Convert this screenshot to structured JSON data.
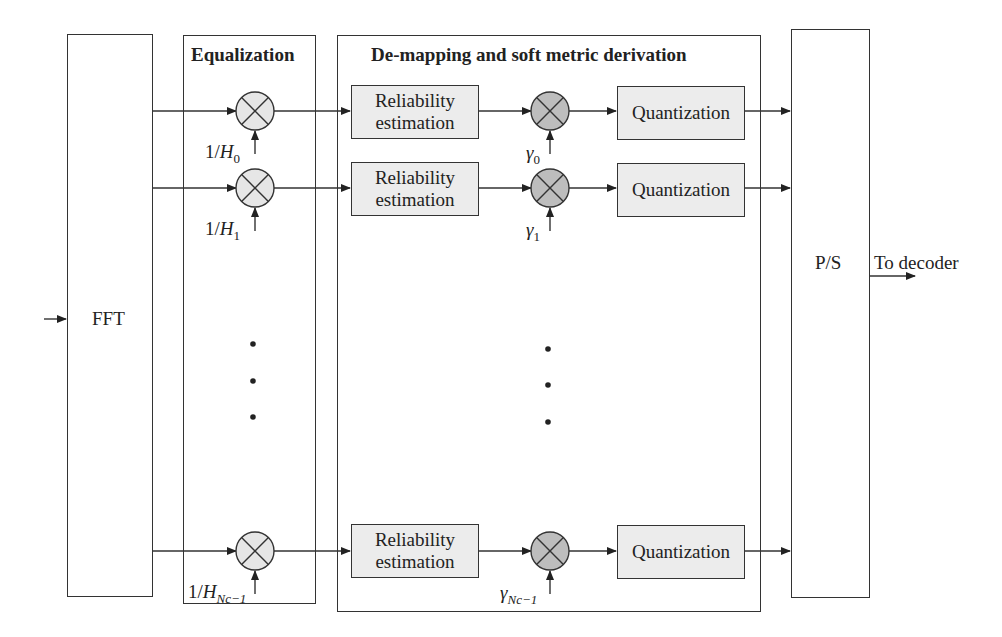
{
  "diagram": {
    "type": "block-diagram",
    "blocks": {
      "fft": "FFT",
      "equalization_title": "Equalization",
      "demapping_title": "De-mapping and soft metric derivation",
      "ps": "P/S",
      "output_label": "To decoder"
    },
    "rows": [
      {
        "eq_gain_prefix": "1/",
        "eq_gain_var": "H",
        "eq_gain_sub": "0",
        "reliability_line1": "Reliability",
        "reliability_line2": "estimation",
        "gamma_var": "γ",
        "gamma_sub": "0",
        "quantization": "Quantization"
      },
      {
        "eq_gain_prefix": "1/",
        "eq_gain_var": "H",
        "eq_gain_sub": "1",
        "reliability_line1": "Reliability",
        "reliability_line2": "estimation",
        "gamma_var": "γ",
        "gamma_sub": "1",
        "quantization": "Quantization"
      },
      {
        "eq_gain_prefix": "1/",
        "eq_gain_var": "H",
        "eq_gain_sub": "Nc−1",
        "reliability_line1": "Reliability",
        "reliability_line2": "estimation",
        "gamma_var": "γ",
        "gamma_sub": "Nc−1",
        "quantization": "Quantization"
      }
    ],
    "colors": {
      "line": "#333333",
      "shaded_box": "#ececec",
      "eq_multiplier_fill": "#e6e6e6",
      "gamma_multiplier_fill": "#bdbdbd"
    }
  }
}
